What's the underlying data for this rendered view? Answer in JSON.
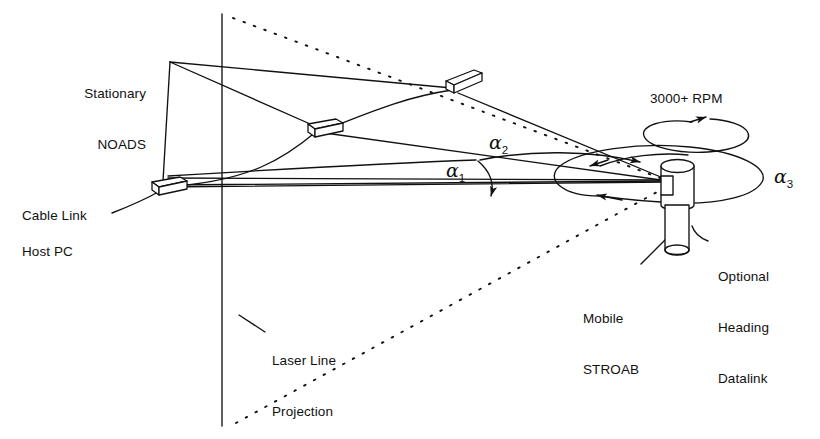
{
  "figure": {
    "background_color": "#ffffff",
    "ink_color": "#111111"
  },
  "labels": {
    "stationary_noads": "Stationary\nNOADS",
    "stationary_line1": "Stationary",
    "stationary_line2": "NOADS",
    "cable_link": "Cable Link",
    "host_pc": "Host PC",
    "laser_line_projection": "Laser Line\nProjection",
    "laser_line1": "Laser Line",
    "laser_line2": "Projection",
    "mobile_stroab": "Mobile\nSTROAB",
    "mobile_line1": "Mobile",
    "mobile_line2": "STROAB",
    "optional_heading_datalink": "Optional\nHeading\nDatalink",
    "optional_line1": "Optional",
    "optional_line2": "Heading",
    "optional_line3": "Datalink",
    "rpm": "3000+ RPM"
  },
  "angles": {
    "alpha1": {
      "symbol": "α",
      "subscript": "1"
    },
    "alpha2": {
      "symbol": "α",
      "subscript": "2"
    },
    "alpha3": {
      "symbol": "α",
      "subscript": "3"
    }
  },
  "components": {
    "noads_count": 3,
    "noads_names": [
      "noads-sensor-left",
      "noads-sensor-middle",
      "noads-sensor-right"
    ],
    "stroab_name": "mobile-stroab-device",
    "laser_lines": 2,
    "rotation_speed": "3000+ RPM"
  },
  "icons": {
    "noads": "sensor-box-icon",
    "stroab": "rotating-beacon-icon",
    "rotation": "circular-arrow-icon",
    "sweep": "ellipse-sweep-icon",
    "leader": "leader-line-icon"
  }
}
